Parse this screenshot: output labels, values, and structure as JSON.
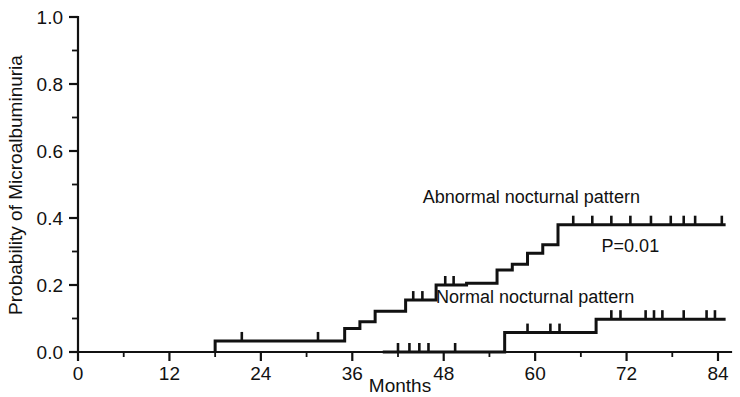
{
  "chart_data": {
    "type": "line",
    "subtype": "kaplan-meier-step",
    "title": "",
    "xlabel": "Months",
    "ylabel": "Probability of Microalbuminuria",
    "xlim": [
      0,
      86
    ],
    "ylim": [
      0.0,
      1.0
    ],
    "grid": false,
    "legend_position": "inline-annotations",
    "x_ticks": [
      0,
      12,
      24,
      36,
      48,
      60,
      72,
      84
    ],
    "x_tick_labels": [
      "0",
      "12",
      "24",
      "36",
      "48",
      "60",
      "72",
      "84"
    ],
    "x_minor_tick_interval": 6,
    "y_ticks": [
      0.0,
      0.2,
      0.4,
      0.6,
      0.8,
      1.0
    ],
    "y_tick_labels": [
      "0.0",
      "0.2",
      "0.4",
      "0.6",
      "0.8",
      "1.0"
    ],
    "y_minor_tick_interval": 0.1,
    "annotations": [
      {
        "id": "pvalue",
        "text": "P=0.01",
        "x": 72.5,
        "y": 0.3
      },
      {
        "id": "abnormal-label",
        "text": "Abnormal nocturnal pattern",
        "x": 59.5,
        "y": 0.445
      },
      {
        "id": "normal-label",
        "text": "Normal nocturnal pattern",
        "x": 60.0,
        "y": 0.145
      }
    ],
    "series": [
      {
        "name": "Abnormal nocturnal pattern",
        "label": "Abnormal nocturnal pattern",
        "color": "#111111",
        "x": [
          18,
          18,
          35,
          35,
          37,
          37,
          39,
          39,
          43,
          43,
          47,
          47,
          51,
          51,
          55,
          55,
          57,
          57,
          59,
          59,
          61,
          61,
          63,
          63,
          85
        ],
        "y": [
          0.0,
          0.033,
          0.033,
          0.07,
          0.07,
          0.09,
          0.09,
          0.122,
          0.122,
          0.155,
          0.155,
          0.2,
          0.2,
          0.205,
          0.205,
          0.245,
          0.245,
          0.262,
          0.262,
          0.295,
          0.295,
          0.32,
          0.32,
          0.38,
          0.38
        ],
        "steps": [
          {
            "month": 18,
            "probability": 0.033
          },
          {
            "month": 35,
            "probability": 0.07
          },
          {
            "month": 37,
            "probability": 0.09
          },
          {
            "month": 39,
            "probability": 0.122
          },
          {
            "month": 43,
            "probability": 0.155
          },
          {
            "month": 47,
            "probability": 0.2
          },
          {
            "month": 51,
            "probability": 0.205
          },
          {
            "month": 55,
            "probability": 0.245
          },
          {
            "month": 57,
            "probability": 0.262
          },
          {
            "month": 59,
            "probability": 0.295
          },
          {
            "month": 61,
            "probability": 0.32
          },
          {
            "month": 63,
            "probability": 0.38
          }
        ],
        "censored": [
          {
            "month": 21.5,
            "probability": 0.033
          },
          {
            "month": 31.5,
            "probability": 0.033
          },
          {
            "month": 44.0,
            "probability": 0.155
          },
          {
            "month": 45.2,
            "probability": 0.155
          },
          {
            "month": 48.2,
            "probability": 0.2
          },
          {
            "month": 49.3,
            "probability": 0.2
          },
          {
            "month": 65.0,
            "probability": 0.38
          },
          {
            "month": 67.5,
            "probability": 0.38
          },
          {
            "month": 70.0,
            "probability": 0.38
          },
          {
            "month": 72.5,
            "probability": 0.38
          },
          {
            "month": 75.2,
            "probability": 0.38
          },
          {
            "month": 77.8,
            "probability": 0.38
          },
          {
            "month": 79.5,
            "probability": 0.38
          },
          {
            "month": 81.0,
            "probability": 0.38
          },
          {
            "month": 84.5,
            "probability": 0.38
          }
        ],
        "plateau_probability": 0.38
      },
      {
        "name": "Normal nocturnal pattern",
        "label": "Normal nocturnal pattern",
        "color": "#111111",
        "x": [
          40,
          40,
          56,
          56,
          68,
          68,
          85
        ],
        "y": [
          0.0,
          0.0,
          0.0,
          0.058,
          0.058,
          0.098,
          0.098
        ],
        "steps": [
          {
            "month": 56,
            "probability": 0.058
          },
          {
            "month": 68,
            "probability": 0.098
          }
        ],
        "censored": [
          {
            "month": 42.0,
            "probability": 0.0
          },
          {
            "month": 43.5,
            "probability": 0.0
          },
          {
            "month": 44.8,
            "probability": 0.0
          },
          {
            "month": 46.0,
            "probability": 0.0
          },
          {
            "month": 49.5,
            "probability": 0.0
          },
          {
            "month": 59.0,
            "probability": 0.058
          },
          {
            "month": 62.0,
            "probability": 0.058
          },
          {
            "month": 63.2,
            "probability": 0.058
          },
          {
            "month": 70.0,
            "probability": 0.098
          },
          {
            "month": 71.2,
            "probability": 0.098
          },
          {
            "month": 74.5,
            "probability": 0.098
          },
          {
            "month": 75.6,
            "probability": 0.098
          },
          {
            "month": 76.7,
            "probability": 0.098
          },
          {
            "month": 79.5,
            "probability": 0.098
          },
          {
            "month": 82.5,
            "probability": 0.098
          },
          {
            "month": 83.6,
            "probability": 0.098
          }
        ],
        "plateau_probability": 0.098
      }
    ],
    "pvalue": "P=0.01"
  },
  "figure": {
    "background_color": "#ffffff",
    "ink_color": "#111111"
  }
}
